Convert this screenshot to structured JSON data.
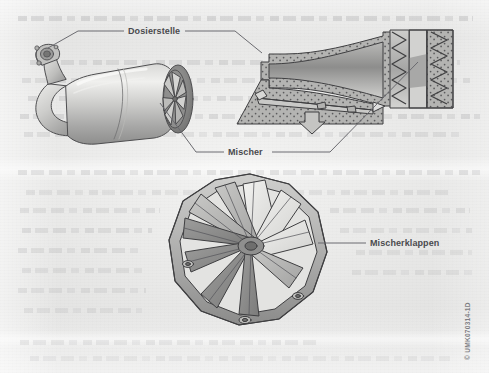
{
  "figure": {
    "background_color": "#ececeb",
    "ink_color": "#4a4a4e",
    "leader_color": "#6b6b70"
  },
  "callouts": [
    {
      "id": "dosierstelle",
      "label": "Dosierstelle",
      "x": 128,
      "y": 27
    },
    {
      "id": "mischer",
      "label": "Mischer",
      "x": 228,
      "y": 149
    },
    {
      "id": "mischerklappen",
      "label": "Mischerklappen",
      "x": 370,
      "y": 240
    }
  ],
  "illustrations": [
    {
      "id": "mixer-housing",
      "name": "Abgasrohr mit Mischer",
      "view": "3d-isometric",
      "parts": [
        "Dosierstelle",
        "Krummer",
        "Mischer"
      ]
    },
    {
      "id": "mixer-section",
      "name": "Schnittdarstellung Mischer",
      "view": "cross-section",
      "parts": [
        "Mischer",
        "Katalysator",
        "Abgasstrom"
      ]
    },
    {
      "id": "mixer-flaps",
      "name": "Mischerklappen",
      "view": "3d-isometric",
      "blade_count": 10
    }
  ],
  "copyright": {
    "text": "© UMK070314-1D"
  }
}
